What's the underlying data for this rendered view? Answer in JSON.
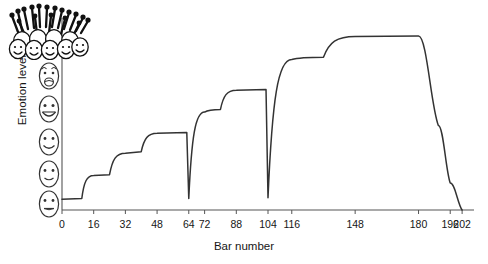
{
  "chart_data": {
    "type": "line",
    "title": "",
    "xlabel": "Bar number",
    "ylabel": "Emotion level",
    "xlim": [
      0,
      208
    ],
    "ylim": [
      0,
      5
    ],
    "grid": false,
    "legend": null,
    "xticks": [
      0,
      16,
      32,
      48,
      64,
      72,
      88,
      104,
      116,
      148,
      180,
      196,
      202
    ],
    "xticklabels": [
      "0",
      "16",
      "32",
      "48",
      "64",
      "72",
      "88",
      "104",
      "116",
      "148",
      "180",
      "196",
      "202"
    ],
    "yticks": [],
    "yticklabels": [],
    "y_axis_icons": [
      {
        "name": "face-ecstatic-crowd",
        "level": 5,
        "expression": "crowd-of-excited-faces-with-arms-raised"
      },
      {
        "name": "face-very-happy",
        "level": 4,
        "expression": "open-mouth-smile"
      },
      {
        "name": "face-happy",
        "level": 3,
        "expression": "broad-smile"
      },
      {
        "name": "face-content",
        "level": 2,
        "expression": "smile"
      },
      {
        "name": "face-slight-smile",
        "level": 1,
        "expression": "small-smile"
      },
      {
        "name": "face-neutral",
        "level": 0,
        "expression": "flat-mouth"
      }
    ],
    "series": [
      {
        "name": "Emotion level",
        "color": "#333333",
        "points": [
          {
            "x": 0,
            "y": 0.28
          },
          {
            "x": 10,
            "y": 0.3
          },
          {
            "x": 16,
            "y": 0.9
          },
          {
            "x": 24,
            "y": 0.92
          },
          {
            "x": 32,
            "y": 1.48
          },
          {
            "x": 40,
            "y": 1.52
          },
          {
            "x": 48,
            "y": 2.0
          },
          {
            "x": 63,
            "y": 2.02
          },
          {
            "x": 64,
            "y": 0.3
          },
          {
            "x": 72,
            "y": 2.55
          },
          {
            "x": 80,
            "y": 2.62
          },
          {
            "x": 88,
            "y": 3.12
          },
          {
            "x": 103,
            "y": 3.14
          },
          {
            "x": 104,
            "y": 0.32
          },
          {
            "x": 116,
            "y": 3.92
          },
          {
            "x": 132,
            "y": 3.98
          },
          {
            "x": 148,
            "y": 4.52
          },
          {
            "x": 180,
            "y": 4.53
          },
          {
            "x": 190,
            "y": 2.2
          },
          {
            "x": 196,
            "y": 0.7
          },
          {
            "x": 202,
            "y": 0.0
          }
        ]
      }
    ]
  },
  "axes": {
    "x_axis_name": "bar-number-axis",
    "y_axis_name": "emotion-level-axis"
  },
  "accent_color": "#333333",
  "axis_color": "#555555"
}
